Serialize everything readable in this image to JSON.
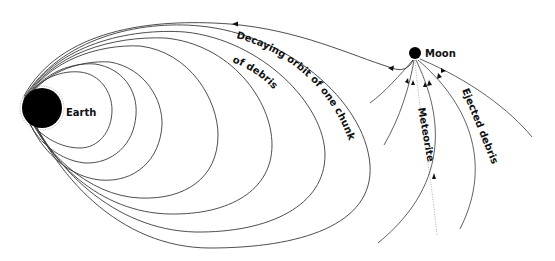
{
  "diagram": {
    "type": "orbital-schematic",
    "bodies": {
      "earth": {
        "label": "Earth",
        "color": "#000000"
      },
      "moon": {
        "label": "Moon",
        "color": "#000000"
      }
    },
    "annotations": {
      "decaying_orbit_line1": "Decaying orbit of one chunk",
      "decaying_orbit_line2": "of debris",
      "meteorite": "Meteorite",
      "ejected_debris": "Ejected debris"
    },
    "orbit_count": 8,
    "line_color": "#3a3a3a",
    "background": "#ffffff"
  }
}
